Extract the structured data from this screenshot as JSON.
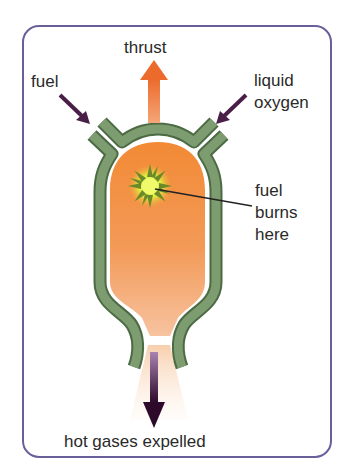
{
  "diagram": {
    "labels": {
      "thrust": "thrust",
      "fuel": "fuel",
      "oxygen_line1": "liquid",
      "oxygen_line2": "oxygen",
      "burn_line1": "fuel",
      "burn_line2": "burns",
      "burn_line3": "here",
      "exhaust": "hot gases expelled"
    },
    "colors": {
      "frame": "#6a5f9a",
      "wall": "#6f8f62",
      "chamber_top": "#f08a3a",
      "chamber_bottom": "#f6b78a",
      "thrust_arrow": "#ee7a3c",
      "input_arrow": "#4a1f47",
      "exhaust_arrow": "#3c1238",
      "flame": "#e2f04a"
    }
  }
}
